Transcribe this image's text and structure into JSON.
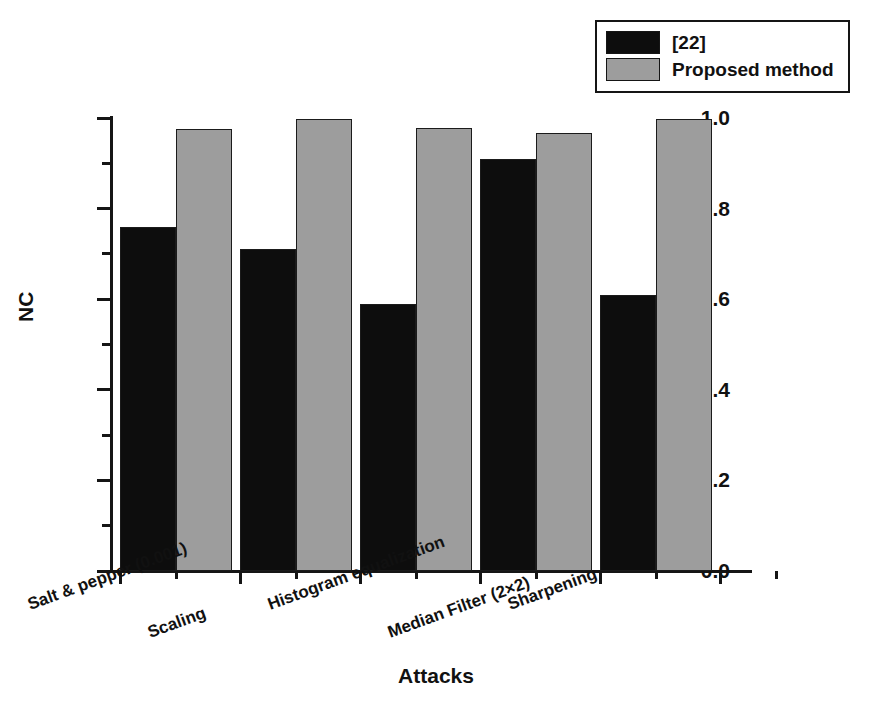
{
  "chart_data": {
    "type": "bar",
    "title": "",
    "xlabel": "Attacks",
    "ylabel": "NC",
    "ylim": [
      0.0,
      1.0
    ],
    "ytick_labels": [
      "0.0",
      "0.2",
      "0.4",
      "0.6",
      "0.8",
      "1.0"
    ],
    "ytick_values": [
      0.0,
      0.2,
      0.4,
      0.6,
      0.8,
      1.0
    ],
    "yminor_values": [
      0.1,
      0.3,
      0.5,
      0.7,
      0.9
    ],
    "grid": false,
    "legend_position": "top-right",
    "categories": [
      "Salt & pepper (0.001)",
      "Scaling",
      "Histogram equalization",
      "Median Filter (2×2)",
      "Sharpening"
    ],
    "series": [
      {
        "name": "[22]",
        "color": "#0d0d0d",
        "values": [
          0.76,
          0.71,
          0.59,
          0.91,
          0.61
        ]
      },
      {
        "name": "Proposed method",
        "color": "#9d9d9d",
        "values": [
          0.975,
          0.997,
          0.978,
          0.966,
          0.997
        ]
      }
    ]
  },
  "legend": {
    "items": [
      {
        "label": "[22]",
        "color": "#0d0d0d"
      },
      {
        "label": "Proposed method",
        "color": "#9d9d9d"
      }
    ]
  },
  "axis": {
    "x_title": "Attacks",
    "y_title": "NC"
  }
}
